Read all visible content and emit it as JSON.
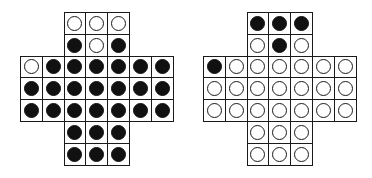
{
  "figure": {
    "cell_size_px": 21.8,
    "colors": {
      "peg_filled": "#111111",
      "peg_empty": "#ffffff",
      "grid_line": "#1a1a1a",
      "background": "#ffffff"
    },
    "legend": {
      "filled": "peg",
      "empty": "hole"
    }
  },
  "boards": [
    {
      "name": "left-board",
      "origin": {
        "x": 20,
        "y": 12
      },
      "rows": [
        "..OOO..",
        "..XOX..",
        "OXXXXXX",
        "XXXXXXX",
        "XXXXXXX",
        "..XXX..",
        "..XXX.."
      ]
    },
    {
      "name": "right-board",
      "origin": {
        "x": 203,
        "y": 12
      },
      "rows": [
        "..XXX..",
        "..OXO..",
        "XOOOOOO",
        "OOOOOOO",
        "OOOOOOO",
        "..OOO..",
        "..OOO.."
      ]
    }
  ]
}
